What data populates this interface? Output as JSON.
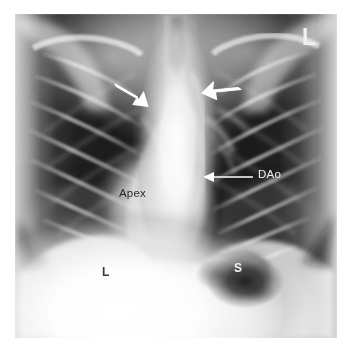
{
  "figure": {
    "modality": "chest-radiograph",
    "view": "frontal-pa",
    "plate_bg_color": "#101010",
    "page_bg_color": "#ffffff",
    "annotation_light_color": "#f2f2f2",
    "annotation_dark_color": "#2b2b2b"
  },
  "annotations": [
    {
      "id": "descending-aorta",
      "label": "DAo",
      "text_color": "#f2f2f2",
      "marker": "arrow-with-leader-line",
      "direction": "left",
      "tip": {
        "x": 203,
        "y": 177
      },
      "tail": {
        "x": 253,
        "y": 177
      }
    },
    {
      "id": "cardiac-apex",
      "label": "Apex",
      "text_color": "#2b2b2b",
      "marker": "none"
    },
    {
      "id": "liver",
      "label": "L",
      "text_color": "#3a3a3a",
      "marker": "none"
    },
    {
      "id": "stomach-gas",
      "label": "S",
      "text_color": "#f4f4f4",
      "marker": "none"
    },
    {
      "id": "left-side-marker",
      "label": "L",
      "text_color": "#f0f0f0",
      "marker": "none"
    },
    {
      "id": "right-paratracheal-arrow",
      "label": "",
      "text_color": "#ffffff",
      "marker": "solid-arrow",
      "direction": "down-right",
      "tip": {
        "x": 146,
        "y": 105
      },
      "tail": {
        "x": 116,
        "y": 88
      }
    },
    {
      "id": "left-paratracheal-arrow",
      "label": "",
      "text_color": "#ffffff",
      "marker": "solid-arrow",
      "direction": "left",
      "tip": {
        "x": 204,
        "y": 94
      },
      "tail": {
        "x": 236,
        "y": 85
      }
    }
  ]
}
